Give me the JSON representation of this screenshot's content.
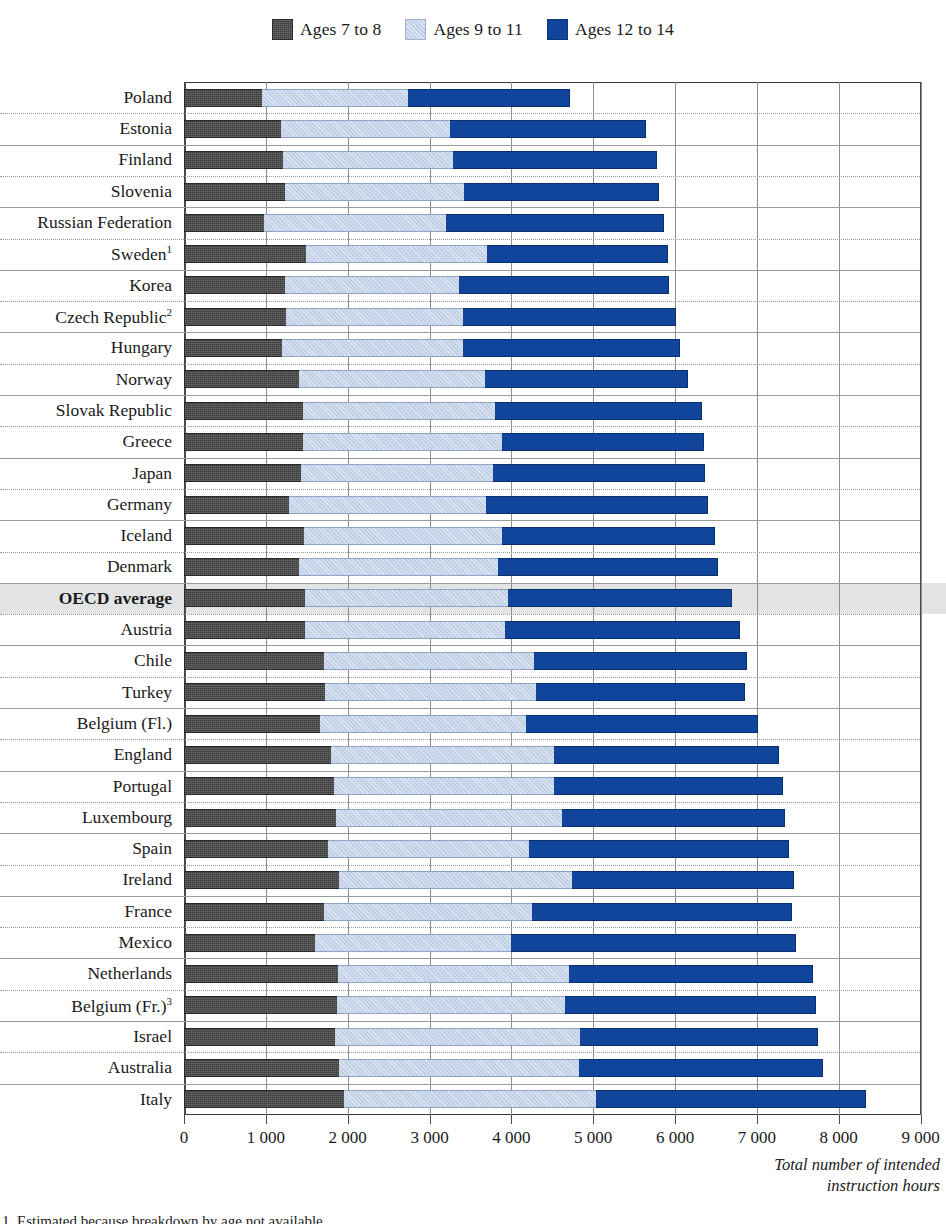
{
  "legend": {
    "items": [
      {
        "label": "Ages 7 to 8",
        "icon": "square-swatch-dark",
        "color": "#3d3d3d"
      },
      {
        "label": "Ages 9 to 11",
        "icon": "square-swatch-light",
        "color": "#c3d1e8"
      },
      {
        "label": "Ages 12 to 14",
        "icon": "square-swatch-blue",
        "color": "#11459b"
      }
    ]
  },
  "axis": {
    "title": "Total number of intended instruction hours",
    "title_line1": "Total number of intended",
    "title_line2": "instruction hours",
    "ticks": [
      "0",
      "1 000",
      "2 000",
      "3 000",
      "4 000",
      "5 000",
      "6 000",
      "7 000",
      "8 000",
      "9 000"
    ]
  },
  "footnote": "1. Estimated because breakdown by age not available.",
  "highlight_row": "OECD average",
  "chart_data": {
    "type": "bar",
    "orientation": "horizontal",
    "stacked": true,
    "title": "",
    "xlabel": "Total number of intended instruction hours",
    "ylabel": "",
    "xlim": [
      0,
      9000
    ],
    "grid": true,
    "legend_position": "top-center",
    "categories": [
      "Poland",
      "Estonia",
      "Finland",
      "Slovenia",
      "Russian Federation",
      "Sweden¹",
      "Korea",
      "Czech Republic²",
      "Hungary",
      "Norway",
      "Slovak Republic",
      "Greece",
      "Japan",
      "Germany",
      "Iceland",
      "Denmark",
      "OECD average",
      "Austria",
      "Chile",
      "Turkey",
      "Belgium (Fl.)",
      "England",
      "Portugal",
      "Luxembourg",
      "Spain",
      "Ireland",
      "France",
      "Mexico",
      "Netherlands",
      "Belgium (Fr.)³",
      "Israel",
      "Australia",
      "Italy"
    ],
    "category_labels": [
      {
        "name": "Poland",
        "sup": ""
      },
      {
        "name": "Estonia",
        "sup": ""
      },
      {
        "name": "Finland",
        "sup": ""
      },
      {
        "name": "Slovenia",
        "sup": ""
      },
      {
        "name": "Russian Federation",
        "sup": ""
      },
      {
        "name": "Sweden",
        "sup": "1"
      },
      {
        "name": "Korea",
        "sup": ""
      },
      {
        "name": "Czech Republic",
        "sup": "2"
      },
      {
        "name": "Hungary",
        "sup": ""
      },
      {
        "name": "Norway",
        "sup": ""
      },
      {
        "name": "Slovak Republic",
        "sup": ""
      },
      {
        "name": "Greece",
        "sup": ""
      },
      {
        "name": "Japan",
        "sup": ""
      },
      {
        "name": "Germany",
        "sup": ""
      },
      {
        "name": "Iceland",
        "sup": ""
      },
      {
        "name": "Denmark",
        "sup": ""
      },
      {
        "name": "OECD average",
        "sup": ""
      },
      {
        "name": "Austria",
        "sup": ""
      },
      {
        "name": "Chile",
        "sup": ""
      },
      {
        "name": "Turkey",
        "sup": ""
      },
      {
        "name": "Belgium (Fl.)",
        "sup": ""
      },
      {
        "name": "England",
        "sup": ""
      },
      {
        "name": "Portugal",
        "sup": ""
      },
      {
        "name": "Luxembourg",
        "sup": ""
      },
      {
        "name": "Spain",
        "sup": ""
      },
      {
        "name": "Ireland",
        "sup": ""
      },
      {
        "name": "France",
        "sup": ""
      },
      {
        "name": "Mexico",
        "sup": ""
      },
      {
        "name": "Netherlands",
        "sup": ""
      },
      {
        "name": "Belgium (Fr.)",
        "sup": "3"
      },
      {
        "name": "Israel",
        "sup": ""
      },
      {
        "name": "Australia",
        "sup": ""
      },
      {
        "name": "Italy",
        "sup": ""
      }
    ],
    "series": [
      {
        "name": "Ages 7 to 8",
        "color": "#3d3d3d",
        "values": [
          950,
          1190,
          1215,
          1230,
          975,
          1490,
          1230,
          1250,
          1200,
          1405,
          1450,
          1450,
          1425,
          1285,
          1465,
          1405,
          1480,
          1475,
          1715,
          1720,
          1660,
          1800,
          1830,
          1860,
          1760,
          1900,
          1705,
          1600,
          1880,
          1870,
          1840,
          1900,
          1960
        ]
      },
      {
        "name": "Ages 9 to 11",
        "color": "#c3d1e8",
        "values": [
          1790,
          2060,
          2070,
          2190,
          2225,
          2215,
          2130,
          2160,
          2215,
          2270,
          2355,
          2440,
          2345,
          2400,
          2415,
          2430,
          2480,
          2445,
          2560,
          2585,
          2520,
          2720,
          2690,
          2760,
          2450,
          2840,
          2550,
          2400,
          2820,
          2790,
          3000,
          2930,
          3080
        ]
      },
      {
        "name": "Ages 12 to 14",
        "color": "#11459b",
        "values": [
          1980,
          2400,
          2490,
          2390,
          2660,
          2210,
          2570,
          2600,
          2650,
          2480,
          2525,
          2465,
          2595,
          2720,
          2615,
          2690,
          2740,
          2875,
          2600,
          2550,
          2830,
          2750,
          2800,
          2730,
          3180,
          2710,
          3180,
          3480,
          2990,
          3060,
          2910,
          2980,
          3290
        ]
      }
    ],
    "totals": [
      4720,
      5650,
      5775,
      5810,
      5860,
      5915,
      5930,
      6010,
      6065,
      6155,
      6330,
      6355,
      6365,
      6405,
      6495,
      6525,
      6700,
      6795,
      6875,
      6855,
      7010,
      7270,
      7320,
      7350,
      7390,
      7450,
      7435,
      7480,
      7690,
      7720,
      7750,
      7810,
      8330
    ]
  }
}
